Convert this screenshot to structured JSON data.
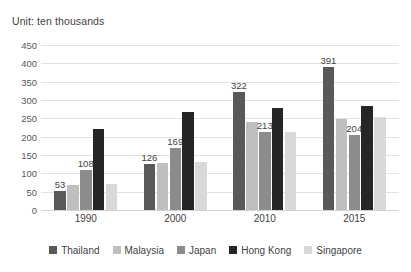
{
  "chart_data": {
    "type": "bar",
    "title": "Unit: ten thousands",
    "xlabel": "",
    "ylabel": "",
    "ylim": [
      0,
      450
    ],
    "ytick_step": 50,
    "yticks": [
      450,
      400,
      350,
      300,
      250,
      200,
      150,
      100,
      50,
      0
    ],
    "grid": true,
    "legend_position": "bottom",
    "categories": [
      "1990",
      "2000",
      "2010",
      "2015"
    ],
    "series": [
      {
        "name": "Thailand",
        "color": "#595959",
        "values": [
          53,
          126,
          322,
          391
        ],
        "labels": [
          "53",
          "126",
          "322",
          "391"
        ]
      },
      {
        "name": "Malaysia",
        "color": "#bfbfbf",
        "values": [
          67,
          127,
          240,
          249
        ],
        "labels": [
          "",
          "",
          "",
          ""
        ]
      },
      {
        "name": "Japan",
        "color": "#8c8c8c",
        "values": [
          108,
          169,
          213,
          204
        ],
        "labels": [
          "108",
          "169",
          "213",
          "204"
        ]
      },
      {
        "name": "Hong Kong",
        "color": "#262626",
        "values": [
          220,
          268,
          278,
          283
        ],
        "labels": [
          "",
          "",
          "",
          ""
        ]
      },
      {
        "name": "Singapore",
        "color": "#d9d9d9",
        "values": [
          72,
          132,
          214,
          253
        ],
        "labels": [
          "",
          "",
          "",
          ""
        ]
      }
    ]
  },
  "legend": {
    "items": [
      {
        "label": "Thailand"
      },
      {
        "label": "Malaysia"
      },
      {
        "label": "Japan"
      },
      {
        "label": "Hong Kong"
      },
      {
        "label": "Singapore"
      }
    ]
  },
  "axis": {
    "y_tick_labels": [
      "450",
      "400",
      "350",
      "300",
      "250",
      "200",
      "150",
      "100",
      "50",
      "0"
    ],
    "x_tick_labels": [
      "1990",
      "2000",
      "2010",
      "2015"
    ]
  }
}
